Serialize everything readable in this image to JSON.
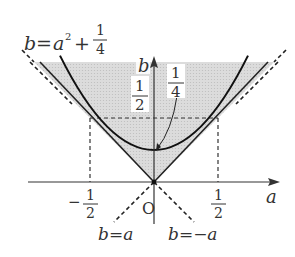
{
  "diagram": {
    "title_equation": {
      "lhs": "b",
      "eq": "=",
      "var": "a",
      "exp": "2",
      "plus": "+",
      "frac_num": "1",
      "frac_den": "4"
    },
    "axes": {
      "x_label": "a",
      "y_label": "b",
      "origin_label": "O"
    },
    "ticks": {
      "neg_half_sign": "−",
      "neg_half_num": "1",
      "neg_half_den": "2",
      "pos_half_num": "1",
      "pos_half_den": "2"
    },
    "annotations": {
      "half_num": "1",
      "half_den": "2",
      "quarter_num": "1",
      "quarter_den": "4"
    },
    "lines": {
      "line1_label": "b=a",
      "line2_label": "b=−a"
    },
    "colors": {
      "shade": "#d9d9d9",
      "stroke": "#222222",
      "text": "#333333"
    }
  }
}
